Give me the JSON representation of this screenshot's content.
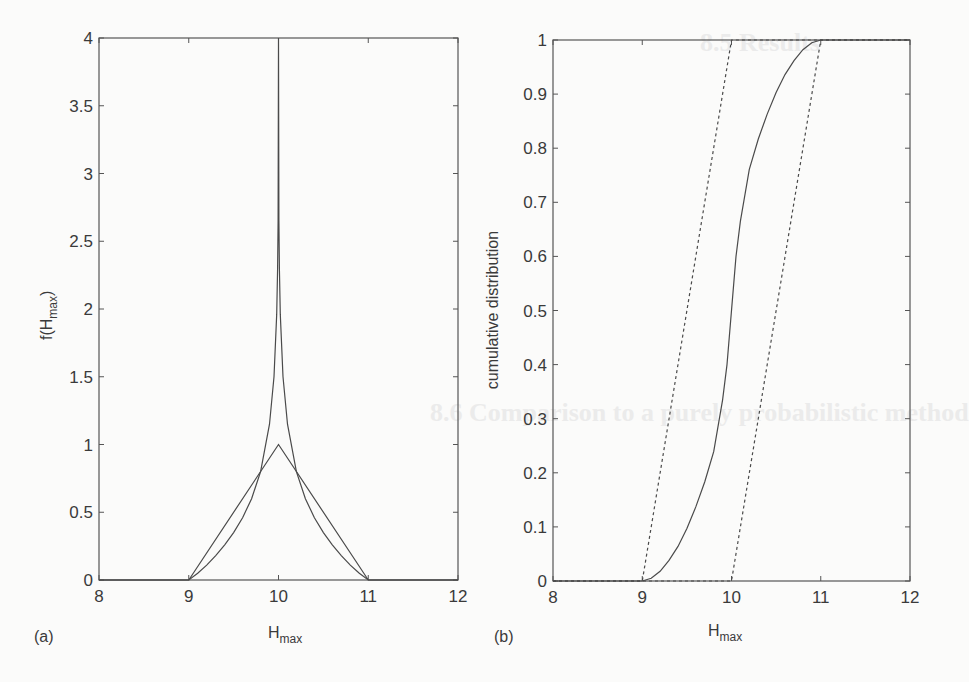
{
  "chart_data": [
    {
      "panel": "(a)",
      "type": "line",
      "title": "",
      "xlabel": "H_max",
      "ylabel": "f(H_max)",
      "xlim": [
        8,
        12
      ],
      "ylim": [
        0,
        4
      ],
      "xticks": [
        8,
        9,
        10,
        11,
        12
      ],
      "yticks": [
        0,
        0.5,
        1,
        1.5,
        2,
        2.5,
        3,
        3.5,
        4
      ],
      "ytick_labels": [
        "0",
        "0.5",
        "1",
        "1.5",
        "2",
        "2.5",
        "3",
        "3.5",
        "4"
      ],
      "grid": false,
      "legend": null,
      "series": [
        {
          "name": "triangular pdf",
          "style": "solid",
          "x": [
            8,
            9,
            10,
            11,
            12
          ],
          "y": [
            0,
            0,
            1,
            0,
            0
          ]
        },
        {
          "name": "log-singular pdf",
          "style": "solid",
          "x": [
            8,
            9,
            9.1,
            9.2,
            9.3,
            9.4,
            9.5,
            9.6,
            9.7,
            9.8,
            9.9,
            9.95,
            9.98,
            9.99,
            9.995,
            10,
            10.005,
            10.01,
            10.02,
            10.05,
            10.1,
            10.2,
            10.3,
            10.4,
            10.5,
            10.6,
            10.7,
            10.8,
            10.9,
            11,
            12
          ],
          "y": [
            0,
            0,
            0.05,
            0.11,
            0.18,
            0.26,
            0.35,
            0.46,
            0.6,
            0.8,
            1.15,
            1.5,
            1.96,
            2.3,
            2.65,
            4,
            2.65,
            2.3,
            1.96,
            1.5,
            1.15,
            0.8,
            0.6,
            0.46,
            0.35,
            0.26,
            0.18,
            0.11,
            0.05,
            0,
            0
          ]
        }
      ]
    },
    {
      "panel": "(b)",
      "type": "line",
      "title": "",
      "xlabel": "H_max",
      "ylabel": "cumulative distribution",
      "xlim": [
        8,
        12
      ],
      "ylim": [
        0,
        1
      ],
      "xticks": [
        8,
        9,
        10,
        11,
        12
      ],
      "yticks": [
        0,
        0.1,
        0.2,
        0.3,
        0.4,
        0.5,
        0.6,
        0.7,
        0.8,
        0.9,
        1
      ],
      "ytick_labels": [
        "0",
        "0.1",
        "0.2",
        "0.3",
        "0.4",
        "0.5",
        "0.6",
        "0.7",
        "0.8",
        "0.9",
        "1"
      ],
      "grid": false,
      "legend": null,
      "series": [
        {
          "name": "lower bound cdf",
          "style": "dashed",
          "x": [
            8,
            9,
            10,
            12
          ],
          "y": [
            0,
            0,
            1,
            1
          ]
        },
        {
          "name": "cdf",
          "style": "solid",
          "x": [
            8,
            9,
            9.1,
            9.2,
            9.3,
            9.4,
            9.5,
            9.6,
            9.7,
            9.8,
            9.9,
            9.95,
            10,
            10.05,
            10.1,
            10.2,
            10.3,
            10.4,
            10.5,
            10.6,
            10.7,
            10.8,
            10.9,
            11,
            12
          ],
          "y": [
            0,
            0,
            0.005,
            0.018,
            0.038,
            0.064,
            0.097,
            0.137,
            0.183,
            0.239,
            0.335,
            0.4,
            0.5,
            0.6,
            0.665,
            0.761,
            0.817,
            0.863,
            0.903,
            0.936,
            0.962,
            0.982,
            0.995,
            1,
            1
          ]
        },
        {
          "name": "upper bound cdf",
          "style": "dashed",
          "x": [
            8,
            10,
            11,
            12
          ],
          "y": [
            0,
            0,
            1,
            1
          ]
        }
      ]
    }
  ],
  "panels": {
    "a": {
      "label": "(a)",
      "xlabel_main": "H",
      "xlabel_sub": "max",
      "ylabel_prefix": "f(H",
      "ylabel_sub": "max",
      "ylabel_suffix": ")",
      "line_color": "#4a4a4a"
    },
    "b": {
      "label": "(b)",
      "xlabel_main": "H",
      "xlabel_sub": "max",
      "ylabel": "cumulative distribution",
      "line_color": "#4a4a4a"
    }
  },
  "bleed_through": {
    "heading_1": "8.5 Results",
    "heading_2": "8.6 Comparison to a purely probabilistic method"
  }
}
